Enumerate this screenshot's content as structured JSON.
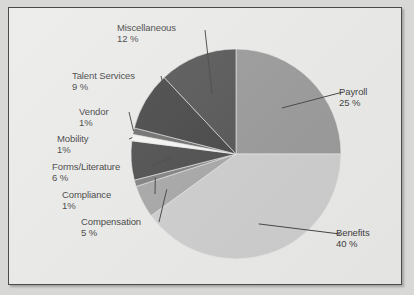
{
  "chart_data": {
    "type": "pie",
    "title": "",
    "categories": [
      "Payroll",
      "Benefits",
      "Compensation",
      "Compliance",
      "Forms/Literature",
      "Mobility",
      "Vendor",
      "Talent Services",
      "Miscellaneous"
    ],
    "values": [
      25,
      40,
      5,
      1,
      6,
      1,
      1,
      9,
      12
    ],
    "unit": "%",
    "legend_position": "callout-labels",
    "grid": false,
    "slice_colors": [
      "#8a8a8a",
      "#c6c6c6",
      "#9a9a9a",
      "#6f6f6f",
      "#333333",
      "#f4f4f2",
      "#5a5a5a",
      "#2b2b2b",
      "#3c3c3c"
    ],
    "start_angle_deg": -90,
    "direction": "clockwise"
  },
  "labels": [
    {
      "name": "payroll",
      "title": "Payroll",
      "pct": "25 %"
    },
    {
      "name": "benefits",
      "title": "Benefits",
      "pct": "40 %"
    },
    {
      "name": "compensation",
      "title": "Compensation",
      "pct": "5 %"
    },
    {
      "name": "compliance",
      "title": "Compliance",
      "pct": "1%"
    },
    {
      "name": "forms-literature",
      "title": "Forms/Literature",
      "pct": "6 %"
    },
    {
      "name": "mobility",
      "title": "Mobility",
      "pct": "1%"
    },
    {
      "name": "vendor",
      "title": "Vendor",
      "pct": "1%"
    },
    {
      "name": "talent-services",
      "title": "Talent Services",
      "pct": "9 %"
    },
    {
      "name": "miscellaneous",
      "title": "Miscellaneous",
      "pct": "12 %"
    }
  ],
  "colors": {
    "background": "#e7e7e5",
    "page": "#d8d8d6",
    "border": "#4b4b4b",
    "text": "#1d1d1d",
    "leader_line": "#2a2a2a"
  }
}
